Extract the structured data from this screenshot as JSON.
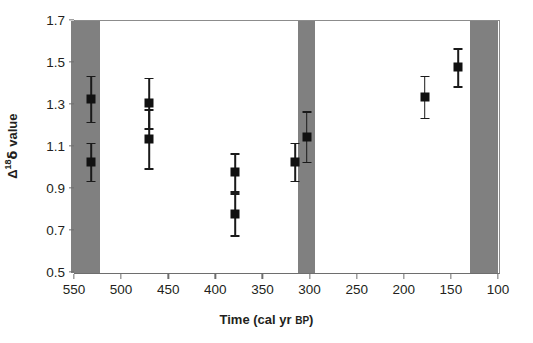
{
  "chart_data": {
    "type": "scatter",
    "title": "",
    "xlabel": "Time (cal yr BP)",
    "xlabel_main": "Time (cal yr ",
    "xlabel_smallcaps": "BP",
    "xlabel_close": ")",
    "ylabel": "Δ¹⁸δ value",
    "ylabel_delta_upper": "Δ",
    "ylabel_superscript": "18",
    "ylabel_delta_lower": "δ",
    "ylabel_word": " value",
    "xlim": [
      550,
      100
    ],
    "ylim": [
      0.5,
      1.7
    ],
    "x_inverted": true,
    "grid": false,
    "legend": "none",
    "xticks": [
      550,
      500,
      450,
      400,
      350,
      300,
      250,
      200,
      150,
      100
    ],
    "xticklabels": [
      "550",
      "500",
      "450",
      "400",
      "350",
      "300",
      "250",
      "200",
      "150",
      "100"
    ],
    "yticks": [
      0.5,
      0.7,
      0.9,
      1.1,
      1.3,
      1.5,
      1.7
    ],
    "yticklabels": [
      "0.5",
      "0.7",
      "0.9",
      "1.1",
      "1.3",
      "1.5",
      "1.7"
    ],
    "marker": "filled-square",
    "marker_color": "#111111",
    "errorbar_color": "#1a1a1a",
    "band_color": "#808080",
    "points": [
      {
        "x": 533,
        "y": 1.33,
        "err": 0.11
      },
      {
        "x": 533,
        "y": 1.03,
        "err": 0.09
      },
      {
        "x": 471,
        "y": 1.31,
        "err": 0.12
      },
      {
        "x": 471,
        "y": 1.14,
        "err": 0.14
      },
      {
        "x": 380,
        "y": 0.98,
        "err": 0.09
      },
      {
        "x": 380,
        "y": 0.78,
        "err": 0.1
      },
      {
        "x": 316,
        "y": 1.03,
        "err": 0.09
      },
      {
        "x": 304,
        "y": 1.15,
        "err": 0.12
      },
      {
        "x": 179,
        "y": 1.34,
        "err": 0.1
      },
      {
        "x": 143,
        "y": 1.48,
        "err": 0.09
      }
    ],
    "shaded_bands": [
      {
        "from": 554,
        "to": 524
      },
      {
        "from": 313,
        "to": 295
      },
      {
        "from": 131,
        "to": 101
      }
    ]
  }
}
